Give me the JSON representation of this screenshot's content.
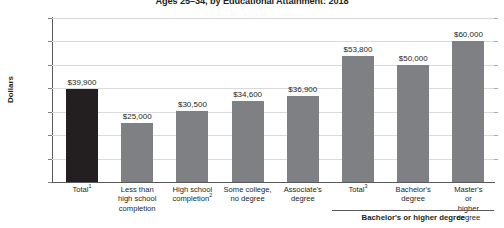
{
  "chart_data": {
    "type": "bar",
    "title": "Ages 25–34, by Educational Attainment: 2018",
    "xlabel": "",
    "ylabel": "Dollars",
    "ylim": [
      0,
      70000
    ],
    "ytick_values": [
      0,
      10000,
      20000,
      30000,
      40000,
      50000,
      60000,
      70000
    ],
    "ytick_labels": [
      "0",
      "10,000",
      "20,000",
      "30,000",
      "40,000",
      "50,000",
      "60,000",
      "$70,000"
    ],
    "grid": true,
    "legend": "none",
    "categories": [
      "Total¹",
      "Less than high school completion",
      "High school completion²",
      "Some college, no degree",
      "Associate's degree",
      "Total³",
      "Bachelor's degree",
      "Master's or higher degree"
    ],
    "category_lines": [
      [
        "Total¹"
      ],
      [
        "Less than",
        "high school",
        "completion"
      ],
      [
        "High school",
        "completion²"
      ],
      [
        "Some college,",
        "no degree"
      ],
      [
        "Associate's",
        "degree"
      ],
      [
        "Total³"
      ],
      [
        "Bachelor's",
        "degree"
      ],
      [
        "Master's or",
        "higher degree"
      ]
    ],
    "values": [
      39900,
      25000,
      30500,
      34600,
      36900,
      53800,
      50000,
      60000
    ],
    "value_labels": [
      "$39,900",
      "$25,000",
      "$30,500",
      "$34,600",
      "$36,900",
      "$53,800",
      "$50,000",
      "$60,000"
    ],
    "bar_colors": [
      "#231f20",
      "#7f8084",
      "#7f8084",
      "#7f8084",
      "#7f8084",
      "#7f8084",
      "#7f8084",
      "#7f8084"
    ],
    "groups": [
      {
        "label": "Bachelor's or higher degree",
        "first_index": 5,
        "last_index": 7
      }
    ],
    "colors": {
      "highlight_bar": "#231f20",
      "bar": "#7f8084",
      "gridline": "#d9dadb",
      "axis": "#58595b",
      "text": "#231f20"
    }
  }
}
